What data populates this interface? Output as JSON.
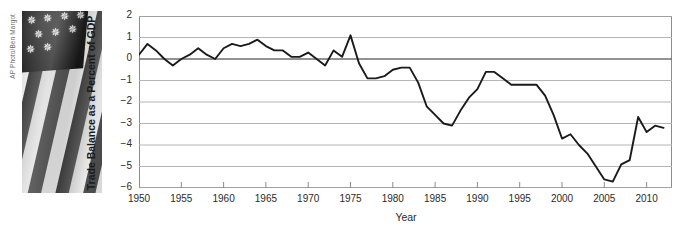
{
  "photo": {
    "credit": "AP Photo/Ben Margot",
    "subject": "american-flag-photo",
    "star_count": 9
  },
  "chart_data": {
    "type": "line",
    "title": "",
    "xlabel": "Year",
    "ylabel": "Trade Balance as a Percent of GDP",
    "xlim": [
      1950,
      2013
    ],
    "ylim": [
      -6,
      2
    ],
    "yticks": [
      2,
      1,
      0,
      -1,
      -2,
      -3,
      -4,
      -5,
      -6
    ],
    "ytick_labels": [
      "2",
      "1",
      "0",
      "−1",
      "−2",
      "−3",
      "−4",
      "−5",
      "−6"
    ],
    "xticks": [
      1950,
      1955,
      1960,
      1965,
      1970,
      1975,
      1980,
      1985,
      1990,
      1995,
      2000,
      2005,
      2010
    ],
    "xtick_labels": [
      "1950",
      "1955",
      "1960",
      "1965",
      "1970",
      "1975",
      "1980",
      "1985",
      "1990",
      "1995",
      "2000",
      "2005",
      "2010"
    ],
    "grid": "horizontal",
    "legend": "none",
    "line_color": "#1a1a1a",
    "grid_color": "#b5b5b5",
    "zero_line_color": "#6e6e6e",
    "frame_color": "#8d8d8d",
    "series": [
      {
        "name": "Trade Balance as a Percent of GDP",
        "x": [
          1950,
          1951,
          1952,
          1953,
          1954,
          1955,
          1956,
          1957,
          1958,
          1959,
          1960,
          1961,
          1962,
          1963,
          1964,
          1965,
          1966,
          1967,
          1968,
          1969,
          1970,
          1971,
          1972,
          1973,
          1974,
          1975,
          1976,
          1977,
          1978,
          1979,
          1980,
          1981,
          1982,
          1983,
          1984,
          1985,
          1986,
          1987,
          1988,
          1989,
          1990,
          1991,
          1992,
          1993,
          1994,
          1995,
          1996,
          1997,
          1998,
          1999,
          2000,
          2001,
          2002,
          2003,
          2004,
          2005,
          2006,
          2007,
          2008,
          2009,
          2010,
          2011,
          2012
        ],
        "values": [
          0.2,
          0.7,
          0.4,
          0.0,
          -0.3,
          0.0,
          0.2,
          0.5,
          0.2,
          0.0,
          0.5,
          0.7,
          0.6,
          0.7,
          0.9,
          0.6,
          0.4,
          0.4,
          0.1,
          0.1,
          0.3,
          0.0,
          -0.3,
          0.4,
          0.1,
          1.1,
          -0.2,
          -0.9,
          -0.9,
          -0.8,
          -0.5,
          -0.4,
          -0.4,
          -1.1,
          -2.2,
          -2.6,
          -3.0,
          -3.1,
          -2.4,
          -1.8,
          -1.4,
          -0.6,
          -0.6,
          -0.9,
          -1.2,
          -1.2,
          -1.2,
          -1.2,
          -1.7,
          -2.6,
          -3.7,
          -3.5,
          -4.0,
          -4.4,
          -5.0,
          -5.6,
          -5.7,
          -4.9,
          -4.7,
          -2.7,
          -3.4,
          -3.1,
          -3.2
        ]
      }
    ]
  }
}
